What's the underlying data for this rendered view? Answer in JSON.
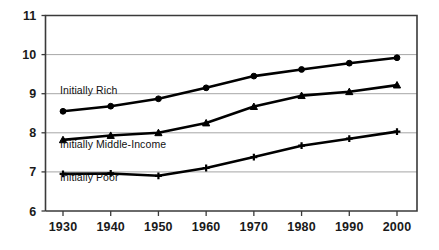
{
  "chart_data": {
    "type": "line",
    "title": "",
    "subtitle": "",
    "xlabel": "",
    "ylabel": "",
    "x": [
      1930,
      1940,
      1950,
      1960,
      1970,
      1980,
      1990,
      2000
    ],
    "xtick_labels": [
      "1930",
      "1940",
      "1950",
      "1960",
      "1970",
      "1980",
      "1990",
      "2000"
    ],
    "ytick_labels": [
      "6",
      "7",
      "8",
      "9",
      "10",
      "11"
    ],
    "ylim": [
      6,
      11
    ],
    "xlim": [
      1925,
      2005
    ],
    "grid": "horizontal",
    "legend_position": "inline-annotation",
    "series": [
      {
        "name": "Initially Rich",
        "marker": "circle",
        "color": "#000000",
        "label_x": 1930,
        "label_y": 9.0,
        "values": [
          8.55,
          8.68,
          8.87,
          9.15,
          9.45,
          9.62,
          9.78,
          9.92
        ]
      },
      {
        "name": "Initially Middle-Income",
        "marker": "triangle",
        "color": "#000000",
        "label_x": 1930,
        "label_y": 7.6,
        "values": [
          7.82,
          7.93,
          8.0,
          8.25,
          8.67,
          8.95,
          9.05,
          9.22
        ]
      },
      {
        "name": "Initially Poor",
        "marker": "plus",
        "color": "#000000",
        "label_x": 1930,
        "label_y": 6.78,
        "values": [
          6.95,
          6.96,
          6.9,
          7.1,
          7.38,
          7.67,
          7.85,
          8.03
        ]
      }
    ],
    "annotations": [
      {
        "text": "Initially Rich"
      },
      {
        "text": "Initially Middle-Income"
      },
      {
        "text": "Initially Poor"
      }
    ]
  }
}
